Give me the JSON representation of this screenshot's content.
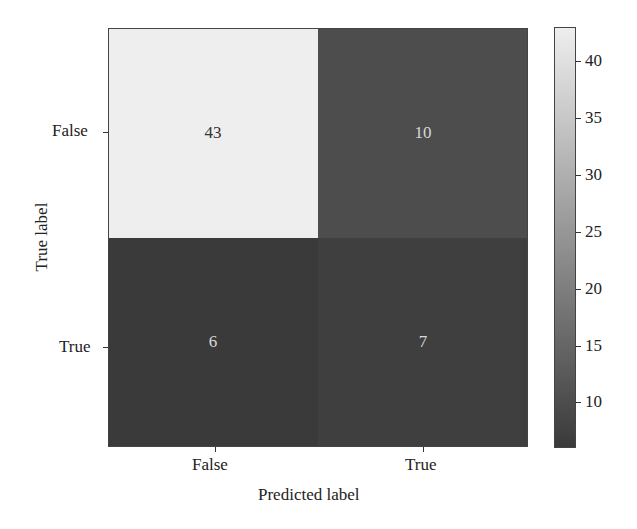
{
  "chart_data": {
    "type": "heatmap",
    "title": "",
    "xlabel": "Predicted label",
    "ylabel": "True label",
    "x_categories": [
      "False",
      "True"
    ],
    "y_categories": [
      "False",
      "True"
    ],
    "matrix": [
      [
        43,
        10
      ],
      [
        6,
        7
      ]
    ],
    "colorbar": {
      "min": 6,
      "max": 43,
      "ticks": [
        10,
        15,
        20,
        25,
        30,
        35,
        40
      ],
      "colormap": "grayscale (dark = low, light = high)"
    },
    "grid": false,
    "legend_position": "right (colorbar)"
  },
  "colors": {
    "high": "#eeeeee",
    "low": "#3a3a3a",
    "text_on_light": "#333333",
    "text_on_dark": "#d8d8d8"
  }
}
